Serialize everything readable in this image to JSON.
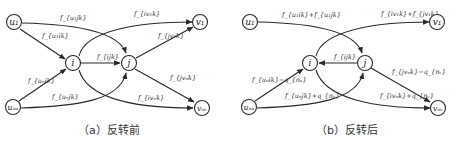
{
  "panels": [
    {
      "id": "a",
      "caption": "（a）反转前",
      "nodes": {
        "u1": "u₁",
        "un": "uₙᵤ",
        "i": "i",
        "j": "j",
        "v1": "v₁",
        "vn": "vₙᵥ"
      },
      "edges": {
        "u1_j": "f_{u₁jk}",
        "u1_i": "f_{u₁ik}",
        "un_i": "f_{uₙik}",
        "un_j": "f_{uₙjk}",
        "i_j": "f_{ijk}",
        "i_v1": "f_{iv₁k}",
        "j_v1": "f_{jv₁k}",
        "j_vn": "f_{jvₙk}",
        "i_vn": "f_{ivₙk}"
      }
    },
    {
      "id": "b",
      "caption": "（b）反转后",
      "nodes": {
        "u1": "u₁",
        "un": "uₙᵤ",
        "i": "i",
        "j": "j",
        "v1": "v₁",
        "vn": "vₙᵥ"
      },
      "edges": {
        "u1_j": "f_{u₁ik}+f_{u₁jk}",
        "un_i": "f_{uₙik}−q_{nᵤ}",
        "un_j": "f_{uₙjk}+q_{nᵤ}",
        "j_i": "f_{ijk}",
        "i_v1": "f_{iv₁k}+f_{jv₁k}",
        "j_vn": "f_{jvₙk}−q_{nᵥ}",
        "i_vn": "f_{ivₙk}+q_{nᵥ}"
      }
    }
  ]
}
